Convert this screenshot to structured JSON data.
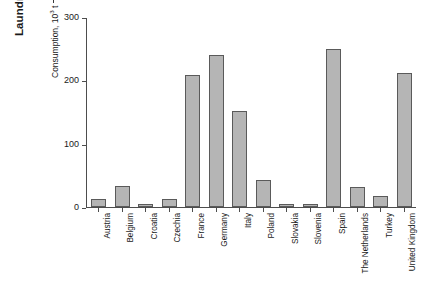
{
  "chart_data": {
    "type": "bar",
    "title": "Laundry Detergents",
    "xlabel": "",
    "ylabel": "Consumption, 10³ t",
    "ylabel_base": "Consumption, 10",
    "ylabel_exponent": "3",
    "ylabel_unit": "t",
    "ylim": [
      0,
      300
    ],
    "yticks": [
      0,
      100,
      200,
      300
    ],
    "ytick_labels": [
      "0",
      "100",
      "200",
      "300"
    ],
    "grid": false,
    "legend": "none",
    "axis_arrow": true,
    "bar_fill_color": "#b5b5b5",
    "bar_border_color": "#5a5a5a",
    "categories": [
      "Austria",
      "Belgium",
      "Croatia",
      "Czechia",
      "France",
      "Germany",
      "Italy",
      "Poland",
      "Slovakia",
      "Slovenia",
      "Spain",
      "The Netherlands",
      "Turkey",
      "United Kingdom"
    ],
    "values": [
      12,
      33,
      5,
      13,
      208,
      240,
      152,
      42,
      5,
      4,
      250,
      31,
      17,
      212
    ]
  }
}
